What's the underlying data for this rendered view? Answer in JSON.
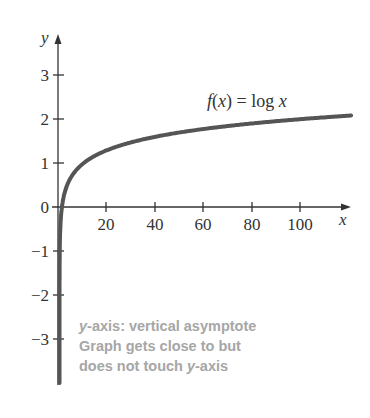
{
  "chart_data": {
    "type": "line",
    "title": "",
    "function_label": "f(x) = log x",
    "xlabel": "x",
    "ylabel": "y",
    "x_ticks": [
      20,
      40,
      60,
      80,
      100
    ],
    "y_ticks": [
      -3,
      -2,
      -1,
      0,
      1,
      2,
      3
    ],
    "xlim": [
      0,
      120
    ],
    "ylim": [
      -4,
      3.7
    ],
    "grid": false,
    "series": [
      {
        "name": "f(x) = log x",
        "x": [
          0.001,
          0.01,
          0.1,
          0.5,
          1,
          2,
          5,
          10,
          20,
          40,
          60,
          80,
          100,
          120
        ],
        "y": [
          -3,
          -2,
          -1,
          -0.3,
          0,
          0.3,
          0.7,
          1,
          1.3,
          1.6,
          1.78,
          1.9,
          2,
          2.08
        ]
      }
    ],
    "annotations": [
      "y-axis: vertical asymptote",
      "Graph gets close to but",
      "does not touch y-axis"
    ],
    "colors": {
      "curve": "#555555",
      "axis": "#333333",
      "annotation": "#a6a6a6"
    }
  },
  "labels": {
    "y_axis": "y",
    "x_axis": "x",
    "function": "f(x) = log x",
    "y_ticks": [
      "3",
      "2",
      "1",
      "0",
      "−1",
      "−2",
      "−3"
    ],
    "x_ticks": [
      "20",
      "40",
      "60",
      "80",
      "100"
    ]
  },
  "note": {
    "line1_italic": "y",
    "line1_rest": "-axis:  vertical asymptote",
    "line2": "Graph gets close to but",
    "line3_pre": "does not touch ",
    "line3_italic": "y",
    "line3_rest": "-axis"
  }
}
